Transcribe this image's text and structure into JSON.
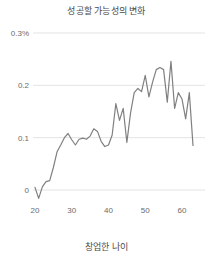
{
  "chart_data": {
    "type": "line",
    "title": "성공할 가능성의 변화",
    "xlabel": "창업한 나이",
    "ylabel": "",
    "xlim": [
      19,
      64
    ],
    "ylim": [
      -0.025,
      0.3
    ],
    "grid": true,
    "legend": null,
    "line_color": "#808080",
    "grid_color": "#dcdcdc",
    "text_color": "#555555",
    "y_ticks": [
      {
        "value": 0.3,
        "label": "0.3%"
      },
      {
        "value": 0.2,
        "label": "0.2"
      },
      {
        "value": 0.1,
        "label": "0.1"
      },
      {
        "value": 0.0,
        "label": "0"
      }
    ],
    "x_ticks": [
      {
        "value": 20,
        "label": "20"
      },
      {
        "value": 30,
        "label": "30"
      },
      {
        "value": 40,
        "label": "40"
      },
      {
        "value": 50,
        "label": "50"
      },
      {
        "value": 60,
        "label": "60"
      }
    ],
    "x": [
      20,
      21,
      22,
      23,
      24,
      25,
      26,
      27,
      28,
      29,
      30,
      31,
      32,
      33,
      34,
      35,
      36,
      37,
      38,
      39,
      40,
      41,
      42,
      43,
      44,
      45,
      46,
      47,
      48,
      49,
      50,
      51,
      52,
      53,
      54,
      55,
      56,
      57,
      58,
      59,
      60,
      61,
      62,
      63
    ],
    "values": [
      0.005,
      -0.016,
      0.006,
      0.016,
      0.018,
      0.043,
      0.073,
      0.086,
      0.1,
      0.108,
      0.096,
      0.086,
      0.097,
      0.099,
      0.097,
      0.103,
      0.117,
      0.112,
      0.093,
      0.083,
      0.086,
      0.105,
      0.165,
      0.133,
      0.156,
      0.091,
      0.147,
      0.186,
      0.194,
      0.188,
      0.219,
      0.178,
      0.206,
      0.23,
      0.234,
      0.23,
      0.168,
      0.246,
      0.156,
      0.186,
      0.174,
      0.136,
      0.186,
      0.085
    ]
  }
}
